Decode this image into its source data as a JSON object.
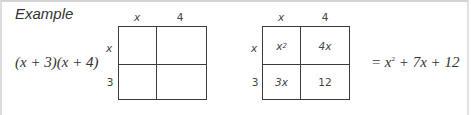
{
  "title": "Example",
  "expression": "(x + 3)(x + 4)",
  "grid_left": {
    "col_headers": [
      "x",
      "4"
    ],
    "row_headers": [
      "x",
      "3"
    ],
    "cells": [
      [
        "",
        ""
      ],
      [
        "",
        ""
      ]
    ]
  },
  "grid_right": {
    "col_headers": [
      "x",
      "4"
    ],
    "row_headers": [
      "x",
      "3"
    ],
    "cells": [
      [
        {
          "base": "x",
          "sup": "2"
        },
        "4x"
      ],
      [
        "3x",
        "12"
      ]
    ]
  },
  "result": {
    "prefix": "= x",
    "sup": "2",
    "suffix": " + 7x + 12"
  }
}
